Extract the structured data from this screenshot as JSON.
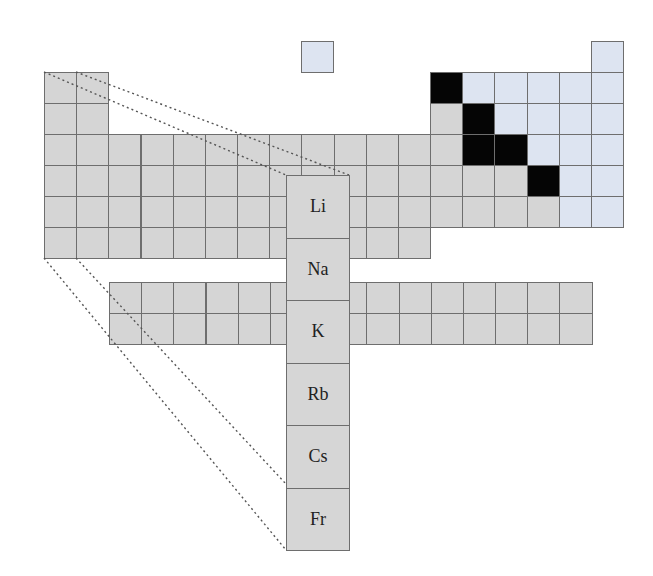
{
  "diagram": {
    "colors": {
      "metal": "#d5d5d5",
      "nonmetal": "#dde4f1",
      "metalloid_staircase": "#050505",
      "border": "#6e6e6e"
    },
    "grid": {
      "origin_x": 44,
      "origin_y": 72,
      "cell_w": 32.17,
      "cell_h": 31,
      "hydrogen": {
        "x": 301,
        "y": 41
      },
      "helium_col": 18,
      "rows": [
        {
          "period": 2,
          "cells": "1-2 metal, 13 black, 14-18 nonmetal"
        },
        {
          "period": 3,
          "cells": "1-2 metal, 13 metal, 14 black, 15-18 nonmetal"
        },
        {
          "period": 4,
          "cells": "1-13 metal, 14-15 black, 16-18 nonmetal"
        },
        {
          "period": 5,
          "cells": "1-15 metal, 16 black, 17-18 nonmetal"
        },
        {
          "period": 6,
          "cells": "1-16 metal, 17-18 nonmetal"
        },
        {
          "period": 7,
          "cells": "1-12 metal"
        }
      ],
      "f_block": {
        "x": 109,
        "y": 282,
        "cols": 15,
        "rows": 2
      }
    },
    "enlarged_group": {
      "x": 286,
      "y": 175,
      "width": 63,
      "cell_h": 62.5,
      "elements": [
        "Li",
        "Na",
        "K",
        "Rb",
        "Cs",
        "Fr"
      ]
    }
  }
}
